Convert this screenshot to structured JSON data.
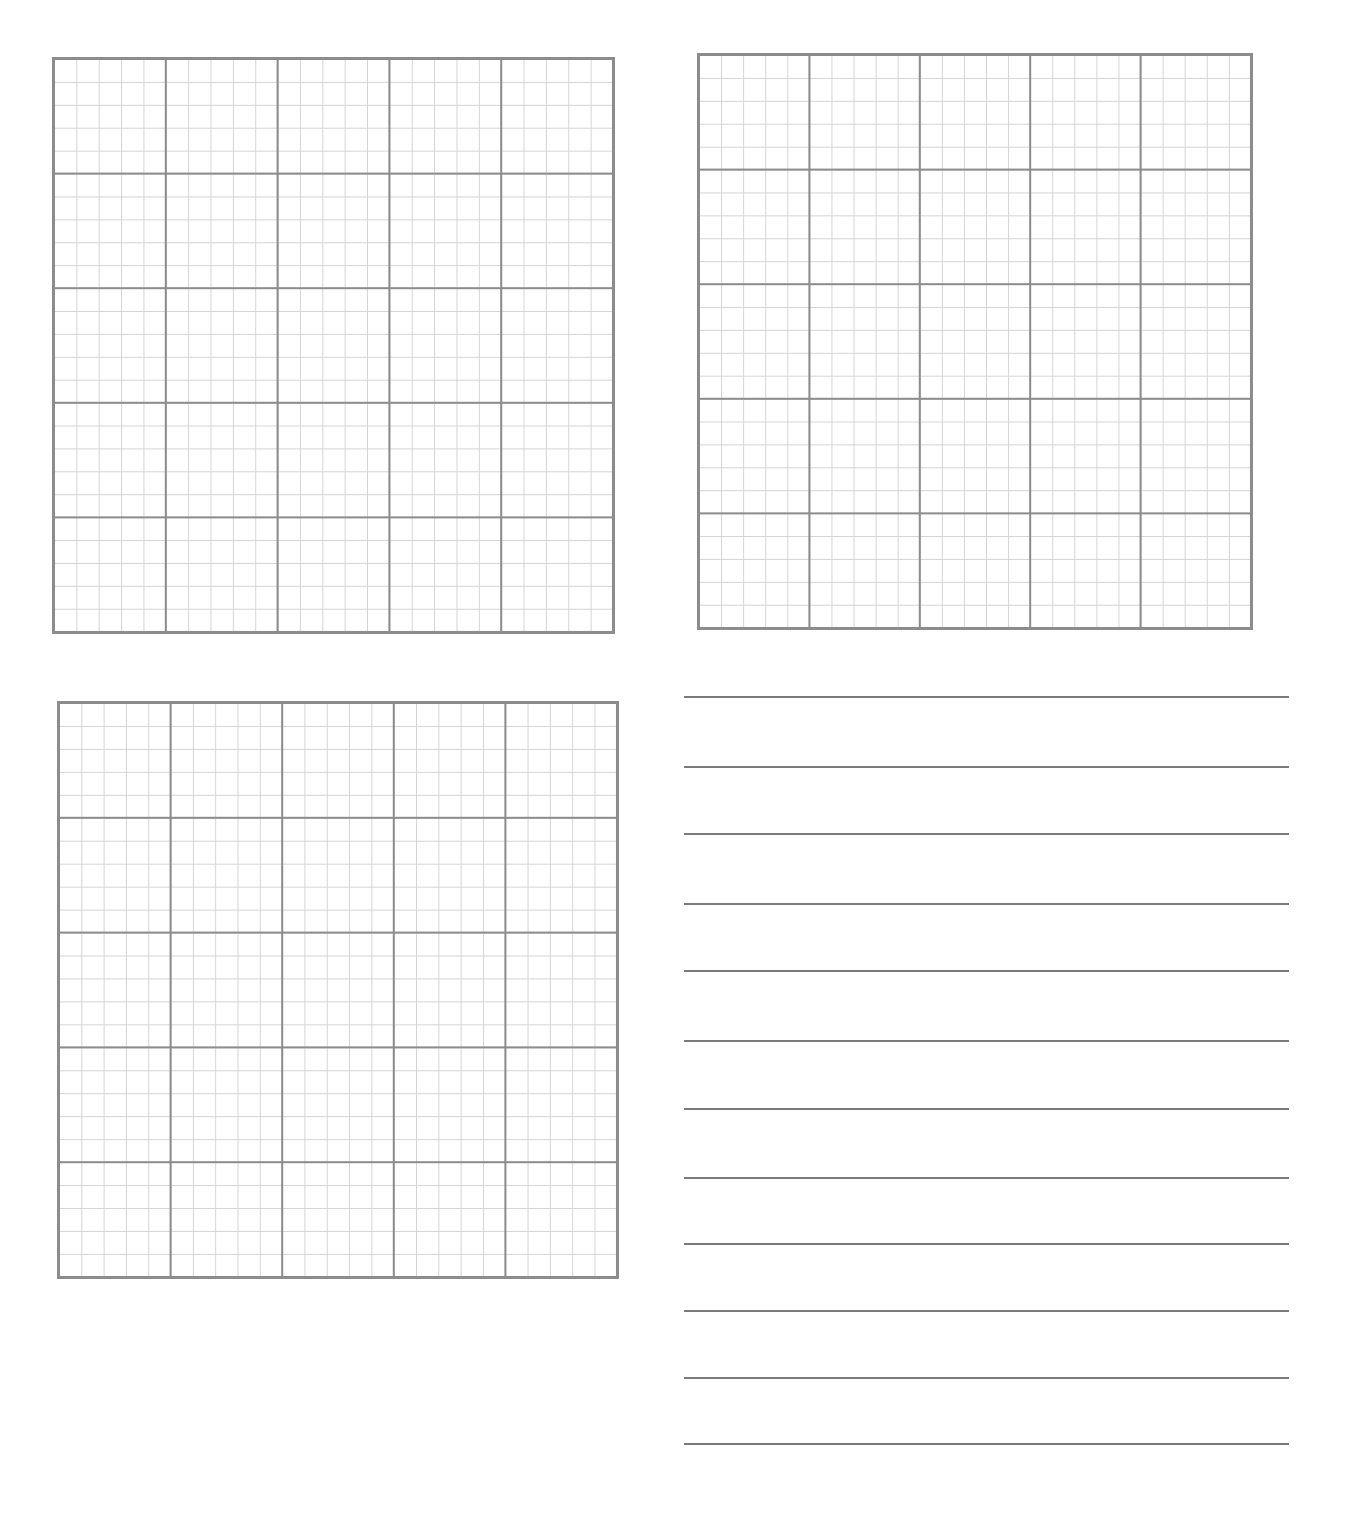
{
  "page": {
    "type": "worksheet",
    "background": "#ffffff"
  },
  "grids": [
    {
      "name": "grid-top-left",
      "x": 52,
      "y": 57,
      "width": 563,
      "height": 577,
      "major_divisions": 5,
      "minor_per_major": 5
    },
    {
      "name": "grid-top-right",
      "x": 697,
      "y": 53,
      "width": 556,
      "height": 577,
      "major_divisions": 5,
      "minor_per_major": 5
    },
    {
      "name": "grid-bottom-left",
      "x": 57,
      "y": 701,
      "width": 562,
      "height": 578,
      "major_divisions": 5,
      "minor_per_major": 5
    }
  ],
  "colors": {
    "major_line": "#8c8c8c",
    "minor_line": "#d4d4d4",
    "rule_line": "#7a7a7a"
  },
  "ruled_lines": {
    "x_start": 684,
    "x_end": 1289,
    "y_positions": [
      696,
      766,
      833,
      903,
      970,
      1040,
      1108,
      1177,
      1243,
      1310,
      1377,
      1443
    ]
  }
}
